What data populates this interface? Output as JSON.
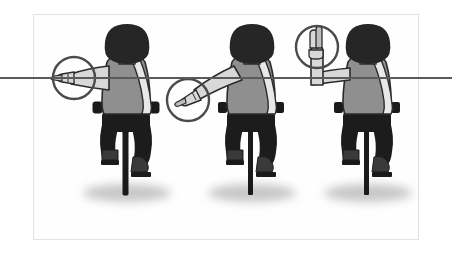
{
  "illustration": {
    "title": "Bicycle hand signals diagram",
    "description": "Three cyclists seen from behind on bicycles, each demonstrating a different arm hand signal, with a circular magnifier highlighting each hand and a horizontal reference line across the scene.",
    "background_color": "#ffffff",
    "frame": {
      "border_color": "#e2e2e2",
      "fill_color": "#fefefe",
      "x": 33,
      "y": 14,
      "width": 386,
      "height": 226
    },
    "reference_line": {
      "name": "horizontal-arm-level-line",
      "color": "#5a5a5a",
      "y": 78,
      "x_start": 0,
      "x_end": 452,
      "thickness": 2
    },
    "palette": {
      "hair": "#262626",
      "skin": "#d8d8d8",
      "skin_shade": "#bdbdbd",
      "shirt": "#8f8f8f",
      "shirt_outline": "#2b2b2b",
      "sash": "#e8e8e8",
      "pants": "#1c1c1c",
      "bike": "#1a1a1a",
      "shoe": "#3a3a3a",
      "shadow": "#9a9a9a",
      "circle_stroke": "#4a4a4a",
      "outline": "#262626"
    },
    "cyclists": [
      {
        "id": "cyclist-left",
        "signal_name": "left-turn-signal",
        "signal_description": "Left arm extended straight out horizontally, hand flat pointing left",
        "arm_direction": "horizontal-left",
        "center_x": 125,
        "highlight_circle": {
          "cx": 74,
          "cy": 78,
          "r": 21
        }
      },
      {
        "id": "cyclist-middle",
        "signal_name": "stop-slow-signal",
        "signal_description": "Left arm extended downward at an angle, hand pointing down and to the left",
        "arm_direction": "diagonal-down-left",
        "center_x": 252,
        "highlight_circle": {
          "cx": 188,
          "cy": 100,
          "r": 21
        }
      },
      {
        "id": "cyclist-right",
        "signal_name": "right-turn-signal",
        "signal_description": "Left arm extended out then bent upward at the elbow, hand raised with fingers up",
        "arm_direction": "bent-up",
        "center_x": 362,
        "highlight_circle": {
          "cx": 317,
          "cy": 47,
          "r": 21
        }
      }
    ],
    "ground_shadows": [
      {
        "cx": 127,
        "cy": 193,
        "rx": 45,
        "ry": 10
      },
      {
        "cx": 252,
        "cy": 193,
        "rx": 45,
        "ry": 10
      },
      {
        "cx": 368,
        "cy": 193,
        "rx": 45,
        "ry": 10
      }
    ]
  }
}
